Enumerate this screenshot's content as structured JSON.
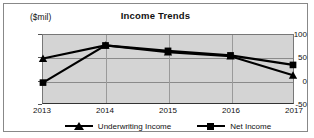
{
  "chart_data": {
    "type": "line",
    "title": "Income Trends",
    "xlabel": "",
    "ylabel": "($mil)",
    "categories": [
      "2013",
      "2014",
      "2015",
      "2016",
      "2017"
    ],
    "ylim": [
      -50,
      100
    ],
    "yticks": [
      100,
      50,
      0,
      -50
    ],
    "ytick_labels": [
      "100",
      "50",
      "0",
      "-50"
    ],
    "grid": true,
    "legend_position": "bottom",
    "plot_background": "#d4d4d4",
    "series_color": "#000000",
    "series": [
      {
        "name": "Underwriting Income",
        "marker": "triangle",
        "values": [
          48,
          77,
          62,
          53,
          11
        ]
      },
      {
        "name": "Net Income",
        "marker": "square",
        "values": [
          -5,
          77,
          65,
          55,
          34
        ]
      }
    ]
  },
  "legend": {
    "entries": [
      {
        "label": "Underwriting Income",
        "marker": "triangle-marker"
      },
      {
        "label": "Net Income",
        "marker": "square-marker"
      }
    ]
  }
}
